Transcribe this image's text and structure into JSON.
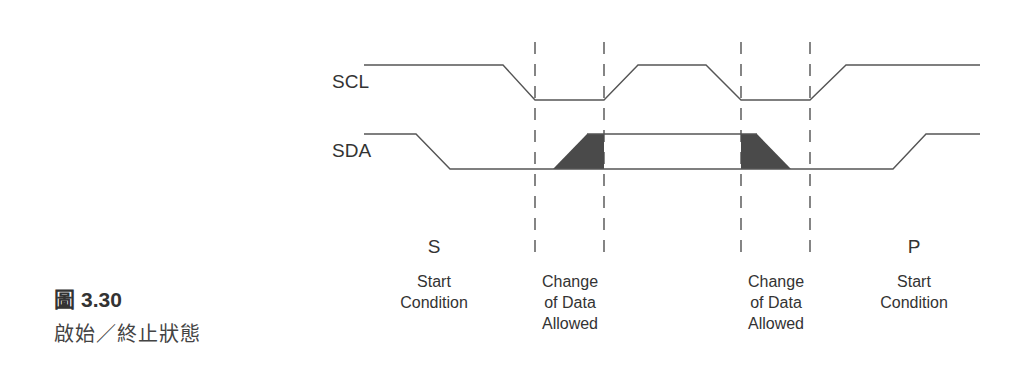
{
  "caption": {
    "figure_prefix": "圖",
    "figure_number": "3.30",
    "title": "啟始／終止狀態"
  },
  "signals": {
    "scl": {
      "label": "SCL",
      "high_y": 65,
      "low_y": 100,
      "points": [
        [
          364,
          65
        ],
        [
          503,
          65
        ],
        [
          535,
          100
        ],
        [
          604,
          100
        ],
        [
          638,
          65
        ],
        [
          706,
          65
        ],
        [
          741,
          100
        ],
        [
          810,
          100
        ],
        [
          846,
          65
        ],
        [
          980,
          65
        ]
      ]
    },
    "sda": {
      "label": "SDA",
      "high_y": 134,
      "low_y": 169,
      "points": [
        [
          364,
          134
        ],
        [
          416,
          134
        ],
        [
          450,
          169
        ],
        [
          980,
          169
        ]
      ],
      "upper_points": [
        [
          587,
          134
        ],
        [
          741,
          134
        ]
      ],
      "tail_points": [
        [
          893,
          169
        ],
        [
          926,
          134
        ],
        [
          980,
          134
        ]
      ]
    }
  },
  "shaded_regions": [
    {
      "name": "data-rise",
      "points": [
        [
          553,
          169
        ],
        [
          587,
          134
        ],
        [
          604,
          134
        ],
        [
          604,
          169
        ]
      ]
    },
    {
      "name": "data-fall",
      "points": [
        [
          741,
          134
        ],
        [
          757,
          134
        ],
        [
          791,
          169
        ],
        [
          741,
          169
        ]
      ]
    }
  ],
  "dashed_lines_x": [
    535,
    604,
    741,
    810
  ],
  "colors": {
    "line": "#555555",
    "fill": "#4a4a4a",
    "dash": "#444444"
  },
  "labels": {
    "s": {
      "symbol": "S",
      "line1": "Start",
      "line2": "Condition"
    },
    "change1": {
      "line1": "Change",
      "line2": "of Data",
      "line3": "Allowed"
    },
    "change2": {
      "line1": "Change",
      "line2": "of Data",
      "line3": "Allowed"
    },
    "p": {
      "symbol": "P",
      "line1": "Start",
      "line2": "Condition"
    }
  }
}
